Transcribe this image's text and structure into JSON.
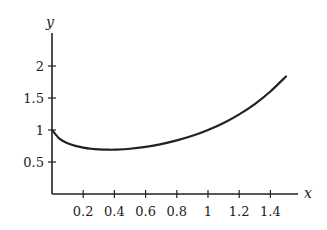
{
  "chart_data": {
    "type": "line",
    "title": "",
    "xlabel": "x",
    "ylabel": "y",
    "xlim": [
      0,
      1.5
    ],
    "ylim": [
      0,
      2.5
    ],
    "grid": false,
    "legend": null,
    "x_ticks": [
      0.2,
      0.4,
      0.6,
      0.8,
      1,
      1.2,
      1.4
    ],
    "x_tick_labels": [
      "0.2",
      "0.4",
      "0.6",
      "0.8",
      "1",
      "1.2",
      "1.4"
    ],
    "y_ticks": [
      0.5,
      1,
      1.5,
      2
    ],
    "y_tick_labels": [
      "0.5",
      "1",
      "1.5",
      "2"
    ],
    "series": [
      {
        "name": "y = x^x",
        "color": "#222222",
        "x": [
          0.0,
          0.05,
          0.1,
          0.15,
          0.2,
          0.25,
          0.3,
          0.368,
          0.4,
          0.5,
          0.6,
          0.7,
          0.8,
          0.9,
          1.0,
          1.1,
          1.2,
          1.3,
          1.4,
          1.5
        ],
        "y": [
          1.0,
          0.861,
          0.794,
          0.752,
          0.725,
          0.707,
          0.697,
          0.692,
          0.693,
          0.707,
          0.736,
          0.779,
          0.837,
          0.909,
          1.0,
          1.11,
          1.245,
          1.406,
          1.602,
          1.837
        ]
      }
    ]
  },
  "axes": {
    "x_label": "x",
    "y_label": "y"
  }
}
